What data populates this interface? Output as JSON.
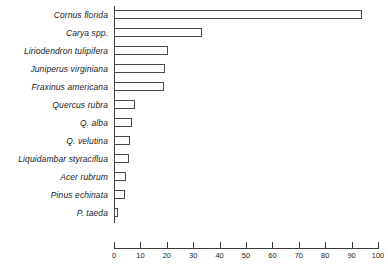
{
  "chart_data": {
    "type": "bar",
    "orientation": "horizontal",
    "title": "",
    "subtitle": "",
    "xlabel": "",
    "ylabel": "",
    "xlim": [
      0,
      100
    ],
    "grid": false,
    "legend": false,
    "xticks": [
      0,
      10,
      20,
      30,
      40,
      50,
      60,
      70,
      80,
      90,
      100
    ],
    "xtick_labels": [
      "0",
      "10",
      "20",
      "30",
      "40",
      "50",
      "60",
      "70",
      "80",
      "90",
      "100"
    ],
    "categories": [
      "Cornus florida",
      "Carya spp.",
      "Liriodendron tulipifera",
      "Juniperus virginiana",
      "Fraxinus americana",
      "Quercus rubra",
      "Q. alba",
      "Q. velutina",
      "Liquidambar styraciflua",
      "Acer rubrum",
      "Pinus echinata",
      "P. taeda"
    ],
    "values": [
      94,
      33.5,
      20.5,
      19.5,
      19,
      8,
      7,
      6,
      5.7,
      4.5,
      4.2,
      1.5
    ],
    "bar_style": {
      "fill": "#ffffff",
      "edge": "#4a4a4a"
    }
  },
  "axis": {
    "line_color": "#3a3a3a"
  }
}
